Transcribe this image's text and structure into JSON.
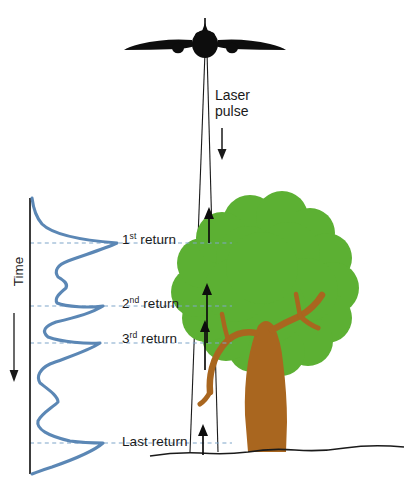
{
  "figure": {
    "background_color": "#ffffff"
  },
  "colors": {
    "waveform": "#5b87b5",
    "dashed_guide": "#7fa6c9",
    "canopy_green": "#5cb033",
    "trunk_brown": "#a9661f",
    "aircraft_black": "#0d0d0d",
    "ground_line": "#1a1a1a",
    "axis_line": "#1a1a1a",
    "text": "#1a1a1a"
  },
  "aircraft": {
    "name": "airplane-front-view",
    "center_x": 205,
    "center_y": 42
  },
  "laser": {
    "label_line1": "Laser",
    "label_line2": "pulse",
    "arrow_direction": "down",
    "beam_apex_x": 205,
    "beam_apex_y": 52,
    "beam_left_bottom_x": 190,
    "beam_right_bottom_x": 218,
    "beam_bottom_y": 452
  },
  "axis": {
    "time_label": "Time",
    "time_arrow_direction": "down",
    "x": 30,
    "top_y": 198,
    "bottom_y": 474
  },
  "returns": [
    {
      "id": "first",
      "label": "1",
      "ordinal": "st",
      "suffix": " return",
      "y": 243,
      "peak_x": 117,
      "arrow": true
    },
    {
      "id": "second",
      "label": "2",
      "ordinal": "nd",
      "suffix": " return",
      "y": 306,
      "peak_x": 103,
      "arrow": true
    },
    {
      "id": "third",
      "label": "3",
      "ordinal": "rd",
      "suffix": " return",
      "y": 343,
      "peak_x": 100,
      "arrow": true
    },
    {
      "id": "last",
      "label": "Last",
      "ordinal": "",
      "suffix": " return",
      "y": 443,
      "peak_x": 103,
      "arrow": true
    }
  ],
  "return_labels": {
    "first_text": "1st return",
    "second_text": "2nd return",
    "third_text": "3rd return",
    "last_text": "Last return"
  },
  "tree": {
    "name": "broadleaf-tree",
    "canopy_center_x": 265,
    "canopy_center_y": 295,
    "trunk_base_x": 258,
    "trunk_base_y": 452
  },
  "ground": {
    "label": "terrain-surface",
    "y": 451
  },
  "chart_data": {
    "type": "line",
    "xlabel": "Return intensity",
    "ylabel": "Time",
    "orientation": "vertical-time-axis",
    "grid": false,
    "legend": false,
    "axis_direction": "time increases downward",
    "guide_lines": [
      243,
      306,
      343,
      443
    ],
    "guide_labels": [
      "1st return",
      "2nd return",
      "3rd return",
      "Last return"
    ],
    "series": [
      {
        "name": "waveform",
        "points": [
          [
            32,
            198
          ],
          [
            34,
            210
          ],
          [
            40,
            222
          ],
          [
            55,
            234
          ],
          [
            80,
            240
          ],
          [
            104,
            242
          ],
          [
            117,
            243
          ],
          [
            110,
            250
          ],
          [
            92,
            256
          ],
          [
            72,
            261
          ],
          [
            58,
            266
          ],
          [
            56,
            272
          ],
          [
            62,
            277
          ],
          [
            68,
            281
          ],
          [
            66,
            287
          ],
          [
            58,
            292
          ],
          [
            55,
            298
          ],
          [
            62,
            303
          ],
          [
            80,
            306
          ],
          [
            95,
            307
          ],
          [
            103,
            306
          ],
          [
            96,
            313
          ],
          [
            78,
            318
          ],
          [
            60,
            321
          ],
          [
            48,
            325
          ],
          [
            44,
            330
          ],
          [
            52,
            336
          ],
          [
            74,
            341
          ],
          [
            92,
            343
          ],
          [
            100,
            343
          ],
          [
            90,
            350
          ],
          [
            70,
            356
          ],
          [
            52,
            362
          ],
          [
            42,
            368
          ],
          [
            38,
            375
          ],
          [
            42,
            382
          ],
          [
            52,
            389
          ],
          [
            60,
            395
          ],
          [
            58,
            402
          ],
          [
            48,
            408
          ],
          [
            40,
            414
          ],
          [
            38,
            421
          ],
          [
            46,
            429
          ],
          [
            68,
            437
          ],
          [
            92,
            442
          ],
          [
            103,
            443
          ],
          [
            96,
            451
          ],
          [
            74,
            459
          ],
          [
            52,
            466
          ],
          [
            38,
            471
          ],
          [
            32,
            474
          ]
        ]
      }
    ]
  }
}
